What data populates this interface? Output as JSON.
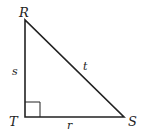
{
  "diagram": {
    "type": "right-triangle",
    "vertices": {
      "R": {
        "label": "R",
        "x": 25,
        "y": 20
      },
      "T": {
        "label": "T",
        "x": 25,
        "y": 117
      },
      "S": {
        "label": "S",
        "x": 124,
        "y": 117
      }
    },
    "sides": {
      "s": {
        "label": "s",
        "between": [
          "R",
          "T"
        ]
      },
      "r": {
        "label": "r",
        "between": [
          "T",
          "S"
        ]
      },
      "t": {
        "label": "t",
        "between": [
          "R",
          "S"
        ]
      }
    },
    "right_angle_at": "T",
    "stroke_color": "#222222"
  }
}
